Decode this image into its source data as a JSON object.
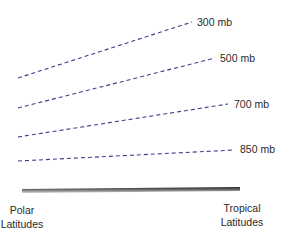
{
  "diagram": {
    "type": "pressure-surfaces-cross-section",
    "line_color": "#3b3f8c",
    "ground_color": "#333333",
    "levels": [
      {
        "label": "300 mb",
        "x1": 18,
        "y1": 78,
        "x2": 192,
        "y2": 22,
        "lx": 197,
        "ly": 17
      },
      {
        "label": "500 mb",
        "x1": 18,
        "y1": 108,
        "x2": 215,
        "y2": 58,
        "lx": 220,
        "ly": 53
      },
      {
        "label": "700 mb",
        "x1": 18,
        "y1": 137,
        "x2": 228,
        "y2": 104,
        "lx": 234,
        "ly": 99
      },
      {
        "label": "850 mb",
        "x1": 18,
        "y1": 161,
        "x2": 234,
        "y2": 150,
        "lx": 240,
        "ly": 144
      }
    ],
    "left_label_line1": "Polar",
    "left_label_line2": "Latitudes",
    "right_label_line1": "Tropical",
    "right_label_line2": "Latitudes"
  }
}
